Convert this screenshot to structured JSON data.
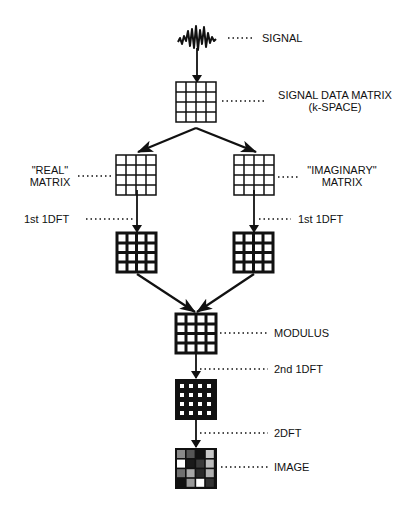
{
  "diagram": {
    "type": "flowchart",
    "title": "",
    "nodes": [
      {
        "id": "signal",
        "label": "SIGNAL",
        "kind": "waveform"
      },
      {
        "id": "kspace",
        "label": "SIGNAL DATA MATRIX",
        "label2": "(k-SPACE)",
        "kind": "matrix-open"
      },
      {
        "id": "real",
        "label": "\"REAL\"",
        "label2": "MATRIX",
        "kind": "matrix-open"
      },
      {
        "id": "imag",
        "label": "\"IMAGINARY\"",
        "label2": "MATRIX",
        "kind": "matrix-open"
      },
      {
        "id": "real_dft",
        "label": "1st 1DFT",
        "kind": "matrix-bold"
      },
      {
        "id": "imag_dft",
        "label": "1st 1DFT",
        "kind": "matrix-bold"
      },
      {
        "id": "modulus",
        "label": "MODULUS",
        "kind": "matrix-bold"
      },
      {
        "id": "second_dft",
        "label": "2nd 1DFT",
        "kind": "matrix-filled"
      },
      {
        "id": "image",
        "label": "IMAGE",
        "kind": "matrix-grayscale"
      }
    ],
    "edge_labels": {
      "second_dft_arrow": "2nd 1DFT",
      "twodft_arrow": "2DFT"
    },
    "edges": [
      {
        "from": "signal",
        "to": "kspace"
      },
      {
        "from": "kspace",
        "to": "real"
      },
      {
        "from": "kspace",
        "to": "imag"
      },
      {
        "from": "real",
        "to": "real_dft"
      },
      {
        "from": "imag",
        "to": "imag_dft"
      },
      {
        "from": "real_dft",
        "to": "modulus"
      },
      {
        "from": "imag_dft",
        "to": "modulus"
      },
      {
        "from": "modulus",
        "to": "second_dft"
      },
      {
        "from": "second_dft",
        "to": "image"
      }
    ],
    "matrix_size": "4x4",
    "image_cells": [
      [
        "#8a8a8a",
        "#555555",
        "#111111",
        "#c8c8c8"
      ],
      [
        "#ffffff",
        "#1a1a1a",
        "#3a3a3a",
        "#bdbdbd"
      ],
      [
        "#707070",
        "#a8a8a8",
        "#2a2a2a",
        "#b0b0b0"
      ],
      [
        "#111111",
        "#9a9a9a",
        "#ffffff",
        "#333333"
      ]
    ],
    "colors": {
      "ink": "#111111",
      "background": "#ffffff"
    }
  },
  "labels": {
    "signal": "SIGNAL",
    "kspace_line1": "SIGNAL DATA MATRIX",
    "kspace_line2": "(k-SPACE)",
    "real_line1": "\"REAL\"",
    "real_line2": "MATRIX",
    "imag_line1": "\"IMAGINARY\"",
    "imag_line2": "MATRIX",
    "left_dft": "1st 1DFT",
    "right_dft": "1st 1DFT",
    "modulus": "MODULUS",
    "second_dft": "2nd 1DFT",
    "twodft": "2DFT",
    "image": "IMAGE"
  }
}
